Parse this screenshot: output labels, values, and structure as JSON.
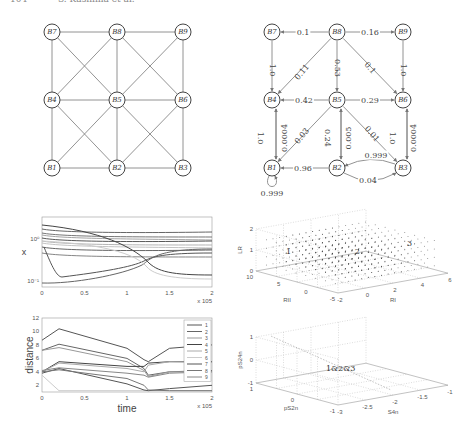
{
  "header": {
    "page_number": "104",
    "authors": "S. Kashima et al."
  },
  "figures": {
    "graph_undirected": {
      "nodes": [
        {
          "id": "B7",
          "x": 52,
          "y": 32
        },
        {
          "id": "B8",
          "x": 117,
          "y": 32
        },
        {
          "id": "B9",
          "x": 183,
          "y": 32
        },
        {
          "id": "B4",
          "x": 52,
          "y": 100
        },
        {
          "id": "B5",
          "x": 117,
          "y": 100
        },
        {
          "id": "B6",
          "x": 183,
          "y": 100
        },
        {
          "id": "B1",
          "x": 52,
          "y": 168
        },
        {
          "id": "B2",
          "x": 117,
          "y": 168
        },
        {
          "id": "B3",
          "x": 183,
          "y": 168
        }
      ]
    },
    "graph_directed": {
      "edges": [
        {
          "from": "B8",
          "to": "B7",
          "weight": "0.1"
        },
        {
          "from": "B8",
          "to": "B9",
          "weight": "0.16"
        },
        {
          "from": "B7",
          "to": "B4",
          "weight": "1.0"
        },
        {
          "from": "B8",
          "to": "B4",
          "weight": "0.11"
        },
        {
          "from": "B8",
          "to": "B5",
          "weight": "0.53"
        },
        {
          "from": "B8",
          "to": "B6",
          "weight": "0.1"
        },
        {
          "from": "B9",
          "to": "B6",
          "weight": "1.0"
        },
        {
          "from": "B5",
          "to": "B4",
          "weight": "0.42"
        },
        {
          "from": "B5",
          "to": "B6",
          "weight": "0.29"
        },
        {
          "from": "B4",
          "to": "B1",
          "weight": "1.0"
        },
        {
          "from": "B1",
          "to": "B4",
          "weight": "0.0004"
        },
        {
          "from": "B5",
          "to": "B1",
          "weight": "0.03"
        },
        {
          "from": "B5",
          "to": "B2",
          "weight": "0.24"
        },
        {
          "from": "B2",
          "to": "B5",
          "weight": "0.005"
        },
        {
          "from": "B5",
          "to": "B3",
          "weight": "0.01"
        },
        {
          "from": "B6",
          "to": "B3",
          "weight": "1.0"
        },
        {
          "from": "B3",
          "to": "B6",
          "weight": "0.0004"
        },
        {
          "from": "B3",
          "to": "B2",
          "weight": "0.999"
        },
        {
          "from": "B2",
          "to": "B3",
          "weight": "0.04"
        },
        {
          "from": "B2",
          "to": "B1",
          "weight": "0.96"
        },
        {
          "from": "B1",
          "to": "B1",
          "weight": "0.999"
        }
      ]
    }
  },
  "chart_data": [
    {
      "type": "line",
      "title": "",
      "xlabel": "",
      "ylabel": "x",
      "yscale": "log",
      "ytick_labels": [
        "10^-1",
        "10^0"
      ],
      "xticks": [
        "0",
        "0.5",
        "1",
        "1.5",
        "2"
      ],
      "x_multiplier": "x 10^5",
      "xlim": [
        0,
        2
      ],
      "series_count": 9,
      "description": "Nine trajectories on log scale; several upper lines nearly flat near 10^0–10^0.5, two lower curves dip toward 10^-1 then cross upper curves near t≈1.2"
    },
    {
      "type": "line",
      "title": "",
      "xlabel": "time",
      "ylabel": "distance",
      "xticks": [
        "0",
        "0.5",
        "1",
        "1.5",
        "2"
      ],
      "x_multiplier": "x 10^5",
      "yticks": [
        "2",
        "4",
        "6",
        "8",
        "10",
        "12"
      ],
      "xlim": [
        0,
        2
      ],
      "ylim": [
        1,
        12
      ],
      "legend": [
        "1",
        "2",
        "3",
        "4",
        "5",
        "6",
        "7",
        "8",
        "9"
      ],
      "legend_position": "upper right",
      "x": [
        0,
        0.2,
        1.0,
        1.2,
        1.25,
        1.5,
        2.0
      ],
      "series": [
        {
          "name": "1",
          "values": [
            8.7,
            10.4,
            7.5,
            5.8,
            5.5,
            7.5,
            8.0
          ]
        },
        {
          "name": "2",
          "values": [
            7.2,
            8.1,
            6.0,
            4.5,
            3.5,
            4.0,
            4.2
          ]
        },
        {
          "name": "3",
          "values": [
            7.2,
            7.6,
            5.5,
            4.2,
            3.3,
            4.0,
            4.0
          ]
        },
        {
          "name": "4",
          "values": [
            4.0,
            5.5,
            4.8,
            4.8,
            5.3,
            5.5,
            5.5
          ]
        },
        {
          "name": "5",
          "values": [
            4.0,
            5.3,
            4.5,
            4.0,
            5.0,
            5.5,
            5.4
          ]
        },
        {
          "name": "6",
          "values": [
            3.5,
            1.2,
            1.2,
            1.2,
            1.2,
            1.2,
            1.2
          ]
        },
        {
          "name": "7",
          "values": [
            3.8,
            4.5,
            2.2,
            1.3,
            1.2,
            1.5,
            2.0
          ]
        },
        {
          "name": "8",
          "values": [
            4.0,
            4.3,
            3.0,
            2.0,
            1.3,
            1.2,
            1.2
          ]
        },
        {
          "name": "9",
          "values": [
            4.2,
            4.6,
            3.8,
            3.5,
            3.2,
            3.8,
            4.0
          ]
        }
      ]
    },
    {
      "type": "scatter",
      "subtype": "3d",
      "xlabel": "RI",
      "ylabel": "RII",
      "zlabel": "LR",
      "xticks": [
        "-2",
        "0",
        "2",
        "4",
        "6"
      ],
      "yticks": [
        "-5",
        "0",
        "5",
        "10"
      ],
      "zticks": [
        "0",
        "1",
        "2"
      ],
      "annotations": [
        "1",
        "2",
        "3"
      ],
      "grid": true
    },
    {
      "type": "scatter",
      "subtype": "3d",
      "xlabel": "S4n",
      "ylabel": "pS2n",
      "zlabel": "pS24n",
      "xticks": [
        "-3",
        "-2.5",
        "-2",
        "-1.5",
        "-1"
      ],
      "yticks": [
        "-1",
        "0",
        "1"
      ],
      "zticks": [
        "-1",
        "0",
        "1"
      ],
      "annotations": [
        "1&2&3"
      ],
      "grid": true
    }
  ]
}
